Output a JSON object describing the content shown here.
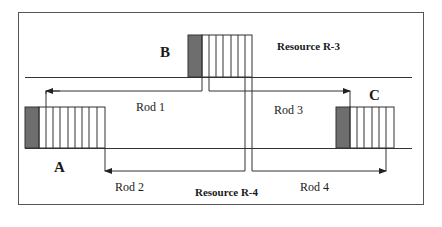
{
  "diagram": {
    "colors": {
      "line": "#333333",
      "frame": "#555555",
      "shaded_cell": "#6e6e6e",
      "background": "#ffffff"
    },
    "resources": [
      {
        "id": "R-3",
        "label": "Resource R-3"
      },
      {
        "id": "R-4",
        "label": "Resource R-4"
      }
    ],
    "blocks": [
      {
        "id": "A",
        "label": "A",
        "cells": 10,
        "shaded_cells": 1
      },
      {
        "id": "B",
        "label": "B",
        "cells": 7,
        "shaded_cells": 1
      },
      {
        "id": "C",
        "label": "C",
        "cells": 7,
        "shaded_cells": 1
      }
    ],
    "rods": [
      {
        "id": "rod1",
        "label": "Rod 1",
        "from": "B",
        "to": "A",
        "direction": "left"
      },
      {
        "id": "rod2",
        "label": "Rod 2",
        "from": "B",
        "to": "A",
        "direction": "left"
      },
      {
        "id": "rod3",
        "label": "Rod 3",
        "from": "B",
        "to": "C",
        "direction": "right"
      },
      {
        "id": "rod4",
        "label": "Rod 4",
        "from": "B",
        "to": "C",
        "direction": "right"
      }
    ]
  }
}
